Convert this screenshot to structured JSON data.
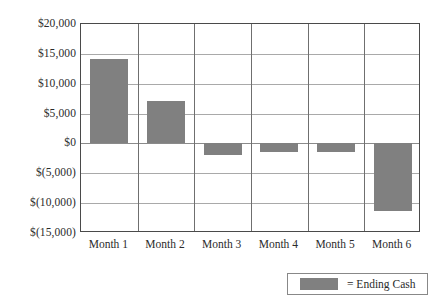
{
  "chart_data": {
    "type": "bar",
    "title": "",
    "subtitle": "",
    "xlabel": "",
    "ylabel": "",
    "categories": [
      "Month 1",
      "Month 2",
      "Month 3",
      "Month 4",
      "Month 5",
      "Month 6"
    ],
    "series": [
      {
        "name": "Ending Cash",
        "color": "#808080",
        "values": [
          14200,
          7100,
          -2000,
          -1500,
          -1500,
          -11300
        ]
      }
    ],
    "ylim": [
      -15000,
      20000
    ],
    "ytick_values": [
      20000,
      15000,
      10000,
      5000,
      0,
      -5000,
      -10000,
      -15000
    ],
    "ytick_labels": [
      "$20,000",
      "$15,000",
      "$10,000",
      "$5,000",
      "$0",
      "$(5,000)",
      "$(10,000)",
      "$(15,000)"
    ],
    "grid": true,
    "grid_horizontal": true,
    "grid_vertical": true,
    "legend_position": "bottom-right",
    "legend_entries": [
      {
        "label": "= Ending Cash",
        "color": "#808080"
      }
    ]
  },
  "colors": {
    "bar_gray": "#808080",
    "plot_border": "#4a4a4a",
    "gridline": "#a9a9a9",
    "column_divider": "#6f6f6f",
    "legend_border": "#888888",
    "text": "#2b2b2b",
    "background": "#ffffff"
  }
}
